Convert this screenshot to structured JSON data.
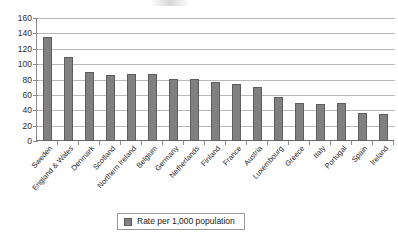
{
  "chart_data": {
    "type": "bar",
    "title": "",
    "xlabel": "",
    "ylabel": "",
    "ylim": [
      0,
      160
    ],
    "yticks": [
      0,
      20,
      40,
      60,
      80,
      100,
      120,
      140,
      160
    ],
    "grid": true,
    "legend_position": "bottom",
    "series_name": "Rate per 1,000 population",
    "categories": [
      "Sweden",
      "England & Wales",
      "Denmark",
      "Scotland",
      "Northern Ireland",
      "Belgium",
      "Germany",
      "Netherlands",
      "Finland",
      "France",
      "Austria",
      "Luxembourg",
      "Greece",
      "Italy",
      "Portugal",
      "Spain",
      "Ireland"
    ],
    "values": [
      135,
      109,
      90,
      86,
      87,
      87,
      81,
      81,
      77,
      74,
      70,
      57,
      50,
      48,
      49,
      36,
      35
    ],
    "series": [
      {
        "name": "Rate per 1,000 population",
        "color": "#808080",
        "values": [
          135,
          109,
          90,
          86,
          87,
          87,
          81,
          81,
          77,
          74,
          70,
          57,
          50,
          48,
          49,
          36,
          35
        ]
      }
    ]
  },
  "legend": {
    "label": "Rate per 1,000 population"
  },
  "colors": {
    "bar_fill": "#808080",
    "bar_border": "#5d5d5d",
    "gridline": "#b9b9b9",
    "axis": "#8a8a8a",
    "text": "#1a1a1a",
    "background": "#ffffff"
  }
}
